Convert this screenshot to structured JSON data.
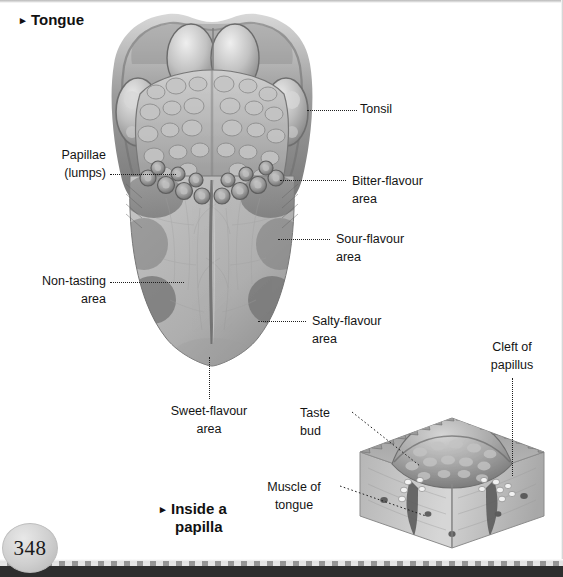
{
  "page": {
    "number": "348",
    "ink_color": "#141414",
    "background": "#ffffff"
  },
  "headings": {
    "main": {
      "bullet": "▸",
      "text": "Tongue"
    },
    "inset": {
      "bullet": "▸",
      "line1": "Inside a",
      "line2": "papilla"
    }
  },
  "tongue_diagram": {
    "labels": {
      "tonsil": {
        "line1": "Tonsil",
        "line2": ""
      },
      "papillae": {
        "line1": "Papillae",
        "line2": "(lumps)"
      },
      "bitter": {
        "line1": "Bitter-flavour",
        "line2": "area"
      },
      "sour": {
        "line1": "Sour-flavour",
        "line2": "area"
      },
      "non_tasting": {
        "line1": "Non-tasting",
        "line2": "area"
      },
      "salty": {
        "line1": "Salty-flavour",
        "line2": "area"
      },
      "sweet": {
        "line1": "Sweet-flavour",
        "line2": "area"
      }
    }
  },
  "papilla_inset": {
    "labels": {
      "cleft": {
        "line1": "Cleft of",
        "line2": "papillus"
      },
      "taste_bud": {
        "line1": "Taste",
        "line2": "bud"
      },
      "muscle": {
        "line1": "Muscle of",
        "line2": "tongue"
      }
    }
  }
}
